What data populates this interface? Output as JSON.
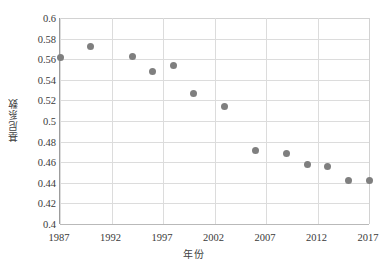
{
  "chart_data": {
    "type": "scatter",
    "title": "",
    "xlabel": "年份",
    "ylabel": "基尼系数",
    "xlim": [
      1987,
      2017
    ],
    "ylim": [
      0.4,
      0.6
    ],
    "grid": true,
    "legend": false,
    "marker_color": "#7f7f7f",
    "x_ticks": [
      "1987",
      "1992",
      "1997",
      "2002",
      "2007",
      "2012",
      "2017"
    ],
    "x_tick_values": [
      1987,
      1992,
      1997,
      2002,
      2007,
      2012,
      2017
    ],
    "y_ticks": [
      "0.4",
      "0.42",
      "0.44",
      "0.46",
      "0.48",
      "0.5",
      "0.52",
      "0.54",
      "0.56",
      "0.58",
      "0.6"
    ],
    "y_tick_values": [
      0.4,
      0.42,
      0.44,
      0.46,
      0.48,
      0.5,
      0.52,
      0.54,
      0.56,
      0.58,
      0.6
    ],
    "x": [
      1987,
      1990,
      1994,
      1996,
      1998,
      2000,
      2003,
      2006,
      2009,
      2011,
      2013,
      2015,
      2017
    ],
    "y": [
      0.562,
      0.572,
      0.563,
      0.548,
      0.554,
      0.527,
      0.514,
      0.471,
      0.468,
      0.458,
      0.456,
      0.442,
      0.442
    ],
    "points": [
      {
        "x": 1987,
        "y": 0.562
      },
      {
        "x": 1990,
        "y": 0.572
      },
      {
        "x": 1994,
        "y": 0.563
      },
      {
        "x": 1996,
        "y": 0.548
      },
      {
        "x": 1998,
        "y": 0.554
      },
      {
        "x": 2000,
        "y": 0.527
      },
      {
        "x": 2003,
        "y": 0.514
      },
      {
        "x": 2006,
        "y": 0.471
      },
      {
        "x": 2009,
        "y": 0.468
      },
      {
        "x": 2011,
        "y": 0.458
      },
      {
        "x": 2013,
        "y": 0.456
      },
      {
        "x": 2015,
        "y": 0.442
      },
      {
        "x": 2017,
        "y": 0.442
      }
    ]
  }
}
